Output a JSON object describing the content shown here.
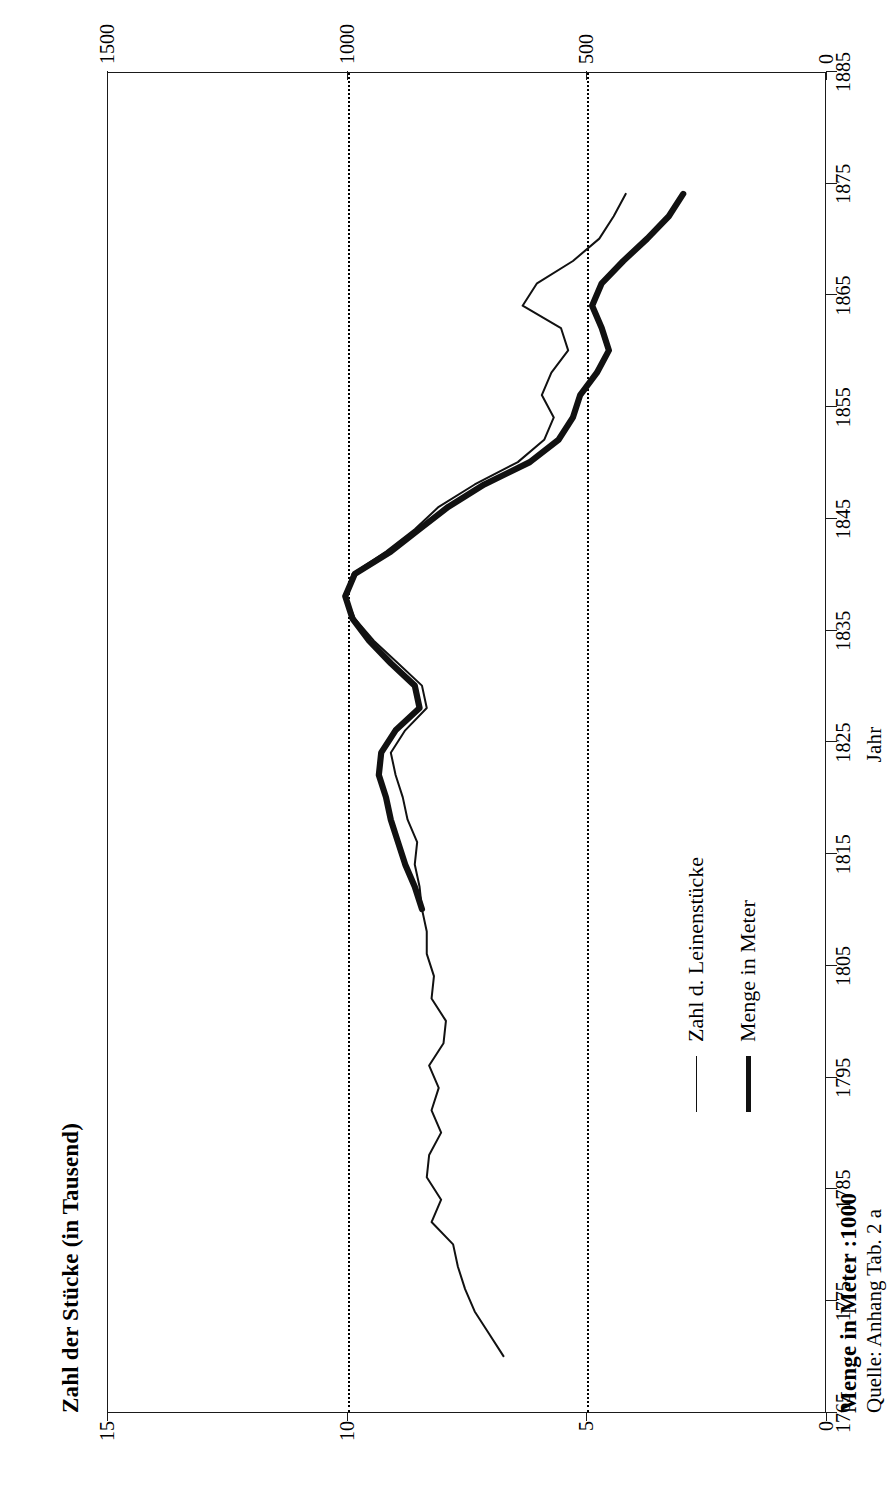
{
  "axis_titles": {
    "left": "Zahl der Stücke (in Tausend)",
    "right": "Menge in Meter :1000",
    "x": "Jahr"
  },
  "source_note": "Quelle:  Anhang Tab. 2 a",
  "legend": {
    "items": [
      {
        "label": "Zahl d. Leinenstücke",
        "style": "thin",
        "color": "#111111"
      },
      {
        "label": "Menge in Meter",
        "style": "thick",
        "color": "#111111"
      }
    ]
  },
  "ticks": {
    "x_years": [
      "1765",
      "1775",
      "1785",
      "1795",
      "1805",
      "1815",
      "1825",
      "1835",
      "1845",
      "1855",
      "1865",
      "1875",
      "1885"
    ],
    "y_left": [
      "0",
      "5",
      "10",
      "15"
    ],
    "y_right": [
      "0",
      "500",
      "1000",
      "1500"
    ]
  },
  "chart_data": {
    "type": "line",
    "title": "",
    "xlabel": "Jahr",
    "ylabel": "Zahl der Stücke (in Tausend)",
    "ylabel_secondary": "Menge in Meter :1000",
    "xlim": [
      1765,
      1885
    ],
    "ylim": [
      0,
      15
    ],
    "ylim_secondary": [
      0,
      1500
    ],
    "grid": "horizontal-dotted at 5 and 10 (Stücke) / 500 and 1000 (Meter)",
    "legend_position": "inside-lower-left",
    "series": [
      {
        "name": "Zahl d. Leinenstücke",
        "axis": "left",
        "unit": "Tausend Stück",
        "style": "thin",
        "x": [
          1770,
          1772,
          1774,
          1776,
          1778,
          1780,
          1782,
          1784,
          1786,
          1788,
          1790,
          1792,
          1794,
          1796,
          1798,
          1800,
          1802,
          1804,
          1806,
          1808,
          1810,
          1812,
          1814,
          1816,
          1818,
          1820,
          1822,
          1824,
          1826,
          1828,
          1830,
          1832,
          1834,
          1836,
          1838,
          1840,
          1842,
          1844,
          1846,
          1848,
          1850,
          1852,
          1854,
          1856,
          1858,
          1860,
          1862,
          1864,
          1866,
          1868,
          1870,
          1872,
          1874
        ],
        "values": [
          6.75,
          7.05,
          7.35,
          7.55,
          7.7,
          7.8,
          8.25,
          8.05,
          8.35,
          8.3,
          8.05,
          8.25,
          8.1,
          8.3,
          8.0,
          7.95,
          8.25,
          8.2,
          8.35,
          8.35,
          8.45,
          8.5,
          8.6,
          8.55,
          8.75,
          8.85,
          9.0,
          9.1,
          8.8,
          8.35,
          8.45,
          8.95,
          9.45,
          9.85,
          10.05,
          9.9,
          9.2,
          8.6,
          8.1,
          7.35,
          6.45,
          5.9,
          5.7,
          5.95,
          5.75,
          5.4,
          5.55,
          6.35,
          6.05,
          5.3,
          4.75,
          4.45,
          4.2
        ]
      },
      {
        "name": "Menge in Meter",
        "axis": "right",
        "unit": "Meter :1000",
        "style": "thick",
        "x": [
          1810,
          1812,
          1814,
          1816,
          1818,
          1820,
          1822,
          1824,
          1826,
          1828,
          1830,
          1832,
          1834,
          1836,
          1838,
          1840,
          1842,
          1844,
          1846,
          1848,
          1850,
          1852,
          1854,
          1856,
          1858,
          1860,
          1862,
          1864,
          1866,
          1868,
          1870,
          1872,
          1874
        ],
        "values": [
          845,
          860,
          880,
          895,
          910,
          920,
          935,
          930,
          900,
          850,
          860,
          910,
          955,
          990,
          1005,
          985,
          910,
          850,
          790,
          715,
          620,
          560,
          530,
          515,
          480,
          455,
          470,
          490,
          470,
          425,
          375,
          330,
          300
        ]
      }
    ]
  }
}
